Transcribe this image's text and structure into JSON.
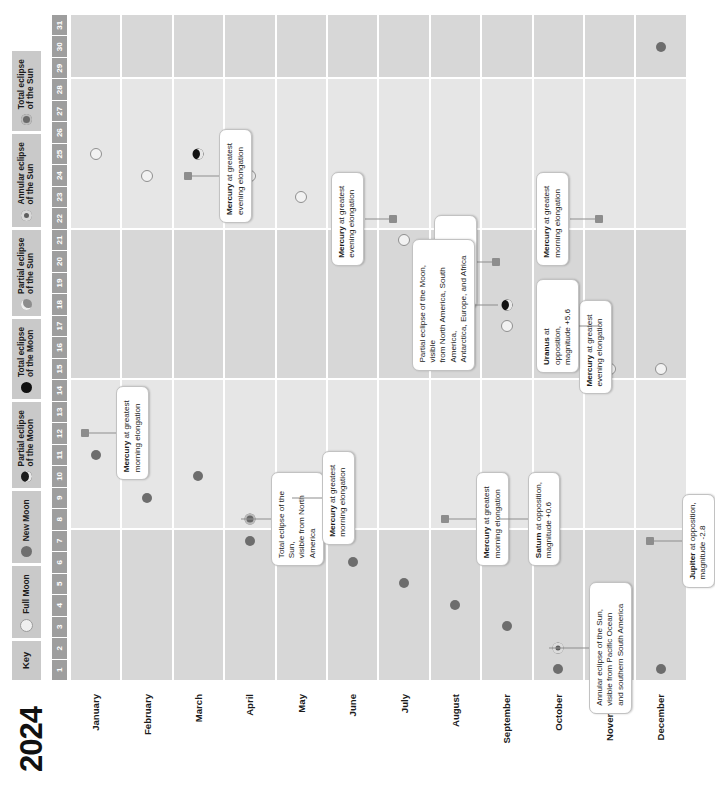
{
  "year": "2024",
  "key": {
    "title": "Key",
    "items": [
      {
        "icon": "full-moon-icon",
        "label": "Full Moon",
        "cls": "k-full"
      },
      {
        "icon": "new-moon-icon",
        "label": "New Moon",
        "cls": "k-new"
      },
      {
        "icon": "partial-lunar-eclipse-icon",
        "label": "Partial eclipse\nof the Moon",
        "cls": "k-pelm"
      },
      {
        "icon": "total-lunar-eclipse-icon",
        "label": "Total eclipse\nof the Moon",
        "cls": "k-telm"
      },
      {
        "icon": "partial-solar-eclipse-icon",
        "label": "Partial eclipse\nof the Sun",
        "cls": "k-pels"
      },
      {
        "icon": "annular-solar-eclipse-icon",
        "label": "Annular eclipse\nof the Sun",
        "cls": "k-anes"
      },
      {
        "icon": "total-solar-eclipse-icon",
        "label": "Total eclipse\nof the Sun",
        "cls": "k-tels"
      }
    ]
  },
  "days": [
    "1",
    "2",
    "3",
    "4",
    "5",
    "6",
    "7",
    "8",
    "9",
    "10",
    "11",
    "12",
    "13",
    "14",
    "15",
    "16",
    "17",
    "18",
    "19",
    "20",
    "21",
    "22",
    "23",
    "24",
    "25",
    "26",
    "27",
    "28",
    "29",
    "30",
    "31"
  ],
  "months": [
    "January",
    "February",
    "March",
    "April",
    "May",
    "June",
    "July",
    "August",
    "September",
    "October",
    "November",
    "December"
  ],
  "chart_data": {
    "type": "table",
    "xlabel": "Day of month",
    "ylabel": "Month",
    "xlim": [
      1,
      31
    ],
    "events": [
      {
        "month": 0,
        "day": 11,
        "type": "new-moon",
        "marker": "m-new"
      },
      {
        "month": 0,
        "day": 25,
        "type": "full-moon",
        "marker": "m-full"
      },
      {
        "month": 1,
        "day": 9,
        "type": "new-moon",
        "marker": "m-new"
      },
      {
        "month": 1,
        "day": 24,
        "type": "full-moon",
        "marker": "m-full"
      },
      {
        "month": 2,
        "day": 10,
        "type": "new-moon",
        "marker": "m-new"
      },
      {
        "month": 2,
        "day": 25,
        "type": "partial-lunar-eclipse",
        "marker": "m-pelm"
      },
      {
        "month": 3,
        "day": 8,
        "type": "total-solar-eclipse",
        "marker": "m-tels"
      },
      {
        "month": 3,
        "day": 7,
        "type": "new-moon",
        "marker": "m-new"
      },
      {
        "month": 3,
        "day": 24,
        "type": "full-moon",
        "marker": "m-full"
      },
      {
        "month": 4,
        "day": 8,
        "type": "new-moon",
        "marker": "m-new"
      },
      {
        "month": 4,
        "day": 23,
        "type": "full-moon",
        "marker": "m-full"
      },
      {
        "month": 5,
        "day": 6,
        "type": "new-moon",
        "marker": "m-new"
      },
      {
        "month": 5,
        "day": 22,
        "type": "full-moon",
        "marker": "m-full"
      },
      {
        "month": 6,
        "day": 5,
        "type": "new-moon",
        "marker": "m-new"
      },
      {
        "month": 6,
        "day": 21,
        "type": "full-moon",
        "marker": "m-full"
      },
      {
        "month": 7,
        "day": 4,
        "type": "new-moon",
        "marker": "m-new"
      },
      {
        "month": 7,
        "day": 19,
        "type": "full-moon",
        "marker": "m-full"
      },
      {
        "month": 8,
        "day": 3,
        "type": "new-moon",
        "marker": "m-new"
      },
      {
        "month": 8,
        "day": 18,
        "type": "partial-lunar-eclipse",
        "marker": "m-pelm"
      },
      {
        "month": 8,
        "day": 17,
        "type": "full-moon",
        "marker": "m-full"
      },
      {
        "month": 9,
        "day": 2,
        "type": "annular-solar-eclipse",
        "marker": "m-anes"
      },
      {
        "month": 9,
        "day": 1,
        "type": "new-moon",
        "marker": "m-new"
      },
      {
        "month": 9,
        "day": 17,
        "type": "full-moon",
        "marker": "m-full"
      },
      {
        "month": 10,
        "day": 1,
        "type": "new-moon",
        "marker": "m-new"
      },
      {
        "month": 10,
        "day": 15,
        "type": "full-moon",
        "marker": "m-full"
      },
      {
        "month": 11,
        "day": 1,
        "type": "new-moon",
        "marker": "m-new"
      },
      {
        "month": 11,
        "day": 15,
        "type": "full-moon",
        "marker": "m-full"
      },
      {
        "month": 11,
        "day": 30,
        "type": "new-moon",
        "marker": "m-new"
      }
    ],
    "planet_markers": [
      {
        "month": 0,
        "day": 12,
        "label": "mercury-jan"
      },
      {
        "month": 2,
        "day": 24,
        "label": "mercury-mar"
      },
      {
        "month": 4,
        "day": 9,
        "label": "mercury-may"
      },
      {
        "month": 6,
        "day": 22,
        "label": "mercury-jul"
      },
      {
        "month": 7,
        "day": 8,
        "label": "mercury-aug"
      },
      {
        "month": 8,
        "day": 20,
        "label": "neptune-sep"
      },
      {
        "month": 8,
        "day": 8,
        "label": "saturn-sep"
      },
      {
        "month": 9,
        "day": 16,
        "label": "mercury-oct"
      },
      {
        "month": 10,
        "day": 17,
        "label": "uranus-nov"
      },
      {
        "month": 10,
        "day": 22,
        "label": "mercury-nov"
      },
      {
        "month": 11,
        "day": 7,
        "label": "jupiter-dec"
      }
    ],
    "callouts": [
      {
        "id": "mercury-jan",
        "month": 0,
        "day": 12,
        "side": "below",
        "bold": "Mercury",
        "rest": " at greatest\nmorning elongation"
      },
      {
        "id": "totaleclipse-apr",
        "month": 3,
        "day": 8,
        "side": "below",
        "bold": "",
        "rest": "Total eclipse of the Sun,\nvisible from North America"
      },
      {
        "id": "mercury-mar",
        "month": 2,
        "day": 24,
        "side": "below",
        "bold": "Mercury",
        "rest": " at greatest\nevening elongation"
      },
      {
        "id": "mercury-may",
        "month": 4,
        "day": 9,
        "side": "below",
        "bold": "Mercury",
        "rest": " at greatest\nmorning elongation"
      },
      {
        "id": "mercury-jul",
        "month": 6,
        "day": 22,
        "side": "above",
        "bold": "Mercury",
        "rest": " at greatest\nevening elongation"
      },
      {
        "id": "mercury-aug",
        "month": 7,
        "day": 8,
        "side": "below",
        "bold": "Mercury",
        "rest": " at greatest\nmorning elongation"
      },
      {
        "id": "saturn-sep",
        "month": 8,
        "day": 8,
        "side": "below",
        "bold": "Saturn",
        "rest": " at opposition,\nmagnitude +0.6"
      },
      {
        "id": "neptune-sep",
        "month": 8,
        "day": 20,
        "side": "above",
        "bold": "Neptune",
        "rest": " at opposition,\nmagnitude +7.8"
      },
      {
        "id": "pelm-sep",
        "month": 8,
        "day": 18,
        "side": "above",
        "bold": "",
        "rest": "Partial eclipse of the Moon, visible\nfrom North America, South America,\nAntarctica, Europe, and Africa"
      },
      {
        "id": "annular-oct",
        "month": 9,
        "day": 2,
        "side": "below",
        "bold": "",
        "rest": "Annular eclipse of the Sun,\nvisible from Pacific Ocean\nand southern South America"
      },
      {
        "id": "mercury-oct",
        "month": 9,
        "day": 16,
        "side": "below",
        "bold": "Mercury",
        "rest": " at greatest\nevening elongation"
      },
      {
        "id": "uranus-nov",
        "month": 10,
        "day": 17,
        "side": "above",
        "bold": "Uranus",
        "rest": " at opposition,\nmagnitude +5.6"
      },
      {
        "id": "mercury-nov",
        "month": 10,
        "day": 22,
        "side": "above",
        "bold": "Mercury",
        "rest": " at greatest\nmorning elongation"
      },
      {
        "id": "jupiter-dec",
        "month": 11,
        "day": 7,
        "side": "below",
        "bold": "Jupiter",
        "rest": " at opposition,\nmagnitude -2.8"
      }
    ]
  }
}
